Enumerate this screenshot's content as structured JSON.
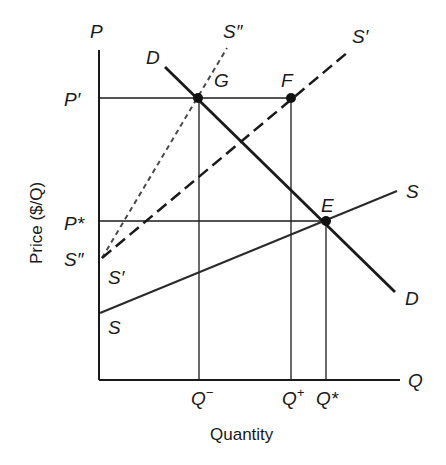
{
  "diagram": {
    "type": "supply-demand",
    "axes": {
      "y_axis_symbol": "P",
      "x_axis_symbol": "Q",
      "y_title": "Price ($/Q)",
      "x_title": "Quantity"
    },
    "price_labels": {
      "p_prime": "P′",
      "p_star": "P*"
    },
    "quantity_labels": {
      "q_minus": "Q",
      "q_minus_sup": "−",
      "q_plus": "Q",
      "q_plus_sup": "+",
      "q_star": "Q*"
    },
    "curves": {
      "demand": {
        "top_label": "D",
        "bottom_label": "D",
        "style": "solid-thick"
      },
      "supply": {
        "right_label": "S",
        "left_label": "S",
        "style": "solid"
      },
      "supply_prime": {
        "top_label": "S′",
        "left_label": "S′",
        "style": "long-dash"
      },
      "supply_double_prime": {
        "top_label": "S″",
        "left_label": "S″",
        "style": "short-dash"
      }
    },
    "points": {
      "g": "G",
      "f": "F",
      "e": "E"
    },
    "colors": {
      "ink": "#1a1a1a",
      "background": "#ffffff"
    }
  }
}
